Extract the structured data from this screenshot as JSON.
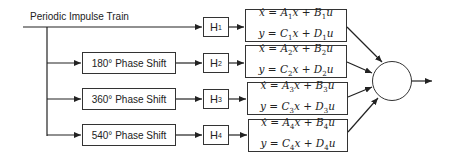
{
  "diagram": {
    "input_label": "Periodic Impulse Train",
    "phase_shifts": [
      {
        "label": "180° Phase Shift"
      },
      {
        "label": "360° Phase Shift"
      },
      {
        "label": "540° Phase Shift"
      }
    ],
    "filters": [
      {
        "name": "H",
        "index": "1"
      },
      {
        "name": "H",
        "index": "2"
      },
      {
        "name": "H",
        "index": "3"
      },
      {
        "name": "H",
        "index": "4"
      }
    ],
    "state_space": [
      {
        "eq1": {
          "lhs": "ẋ = A",
          "i1": "1",
          "mid": "x + B",
          "i2": "1",
          "rhs": "u"
        },
        "eq2": {
          "lhs": "y = C",
          "i1": "1",
          "mid": "x + D",
          "i2": "1",
          "rhs": "u"
        }
      },
      {
        "eq1": {
          "lhs": "ẋ = A",
          "i1": "2",
          "mid": "x + B",
          "i2": "2",
          "rhs": "u"
        },
        "eq2": {
          "lhs": "y = C",
          "i1": "2",
          "mid": "x + D",
          "i2": "2",
          "rhs": "u"
        }
      },
      {
        "eq1": {
          "lhs": "ẋ = A",
          "i1": "3",
          "mid": "x + B",
          "i2": "3",
          "rhs": "u"
        },
        "eq2": {
          "lhs": "y = C",
          "i1": "3",
          "mid": "x + D",
          "i2": "3",
          "rhs": "u"
        }
      },
      {
        "eq1": {
          "lhs": "ẋ = A",
          "i1": "4",
          "mid": "x + B",
          "i2": "4",
          "rhs": "u"
        },
        "eq2": {
          "lhs": "y = C",
          "i1": "4",
          "mid": "x + D",
          "i2": "4",
          "rhs": "u"
        }
      }
    ],
    "colors": {
      "line": "#222222",
      "background": "#ffffff"
    }
  }
}
